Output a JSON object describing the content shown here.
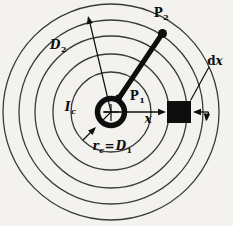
{
  "diagram": {
    "colors": {
      "background": "#f3f2ee",
      "field_line": "#3a3a3a",
      "ink": "#0e0e0e"
    },
    "labels": {
      "p2": {
        "base": "P",
        "sub": "2"
      },
      "d2": {
        "base": "D",
        "sub": "2"
      },
      "p1": {
        "base": "P",
        "sub": "1"
      },
      "ic": {
        "base": "I",
        "sub": "c"
      },
      "x": {
        "base": "x"
      },
      "dx": {
        "d": "d",
        "x": "x"
      },
      "rc": {
        "base": "r",
        "sub": "c"
      },
      "eq": "=",
      "d1": {
        "base": "D",
        "sub": "1"
      }
    }
  }
}
